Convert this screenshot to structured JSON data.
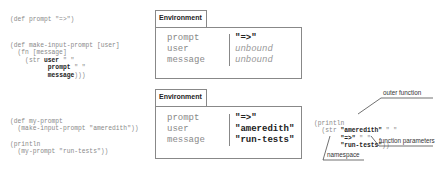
{
  "code_top": {
    "line1": "(def prompt \"=>\")",
    "line2": "(def make-input-prompt [user]",
    "line3": "  (fn [message]",
    "line4_pre": "    (str ",
    "line4_b": "user",
    "line4_post": " \" \"",
    "line5_b": "prompt",
    "line5_post": " \" \"",
    "line6_b": "message",
    "line6_post": ")))"
  },
  "env1": {
    "tab_label": "Environment",
    "rows": [
      {
        "key": "prompt",
        "value": "\"=>\""
      },
      {
        "key": "user",
        "value": "unbound"
      },
      {
        "key": "message",
        "value": "unbound"
      }
    ]
  },
  "code_bottom": {
    "line1": "(def my-prompt",
    "line2": "  (make-input-prompt \"ameredith\"))",
    "line3": "(println",
    "line4": "  (my-prompt \"run-tests\"))"
  },
  "env2": {
    "tab_label": "Environment",
    "rows": [
      {
        "key": "prompt",
        "value": "\"=>\""
      },
      {
        "key": "user",
        "value": "\"ameredith\""
      },
      {
        "key": "message",
        "value": "\"run-tests\""
      }
    ]
  },
  "expansion": {
    "line1": "(println",
    "line2_pre": "  (str ",
    "line2_b": "\"ameredith\"",
    "line2_post": " \" \"",
    "line3_b": "\"=>\"",
    "line3_post": " \" \"",
    "line4_b": "\"run-tests\"",
    "line4_post": "))"
  },
  "annotations": {
    "outer_function": "outer function",
    "function_parameters": "function parameters",
    "namespace": "namespace"
  }
}
